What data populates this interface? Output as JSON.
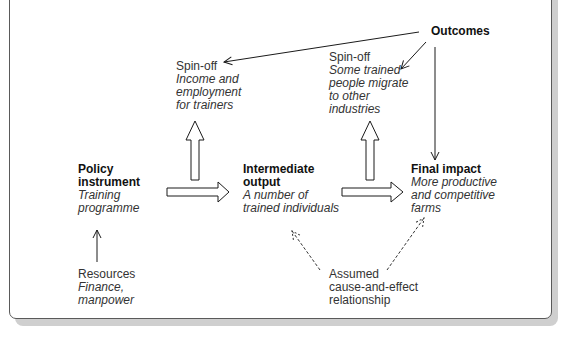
{
  "diagram": {
    "nodes": {
      "outcomes": {
        "title": "Outcomes"
      },
      "spinoff_trainers": {
        "title": "Spin-off",
        "lines": [
          "Income and",
          "employment",
          "for trainers"
        ]
      },
      "spinoff_migration": {
        "title": "Spin-off",
        "lines": [
          "Some trained",
          "people migrate",
          "to other",
          "industries"
        ]
      },
      "policy_instrument": {
        "title_lines": [
          "Policy",
          "instrument"
        ],
        "lines": [
          "Training",
          "programme"
        ]
      },
      "intermediate_output": {
        "title_lines": [
          "Intermediate",
          "output"
        ],
        "lines": [
          "A number of",
          "trained individuals"
        ]
      },
      "final_impact": {
        "title": "Final impact",
        "lines": [
          "More productive",
          "and competitive",
          "farms"
        ]
      },
      "resources": {
        "title": "Resources",
        "lines": [
          "Finance,",
          "manpower"
        ]
      },
      "assumed_relationship": {
        "lines": [
          "Assumed",
          "cause-and-effect",
          "relationship"
        ]
      }
    },
    "edges": [
      {
        "from": "resources",
        "to": "policy_instrument",
        "style": "thin-arrow"
      },
      {
        "from": "policy_instrument",
        "to": "intermediate_output",
        "style": "block-arrow"
      },
      {
        "from": "intermediate_output",
        "to": "final_impact",
        "style": "block-arrow"
      },
      {
        "from": "intermediate_output",
        "to": "spinoff_trainers",
        "style": "block-arrow"
      },
      {
        "from": "final_impact",
        "to": "spinoff_migration",
        "style": "block-arrow"
      },
      {
        "from": "outcomes",
        "to": "spinoff_trainers",
        "style": "thin-arrow"
      },
      {
        "from": "outcomes",
        "to": "spinoff_migration",
        "style": "thin-arrow"
      },
      {
        "from": "outcomes",
        "to": "final_impact",
        "style": "thin-arrow"
      },
      {
        "from": "assumed_relationship",
        "to": "intermediate_output",
        "style": "dashed-arrow"
      },
      {
        "from": "assumed_relationship",
        "to": "final_impact",
        "style": "dashed-arrow"
      }
    ],
    "colors": {
      "line": "#1a1a1a",
      "frame_border": "#5a5a5a",
      "shadow": "#cfcfcf",
      "background": "#ffffff"
    }
  }
}
